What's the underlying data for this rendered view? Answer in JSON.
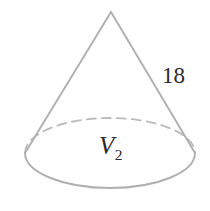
{
  "figure": {
    "type": "cone",
    "labels": {
      "slant_height": "18",
      "volume_symbol": "V",
      "volume_subscript": "2"
    },
    "colors": {
      "stroke": "#b0b0b0",
      "stroke_hidden": "#bcbcbc",
      "text": "#2b2b2b",
      "background": "#ffffff"
    },
    "geometry": {
      "apex_x": 111,
      "apex_y": 12,
      "base_center_x": 110,
      "base_center_y": 153,
      "base_rx": 85,
      "base_ry": 35,
      "canvas_width": 210,
      "canvas_height": 211
    }
  }
}
